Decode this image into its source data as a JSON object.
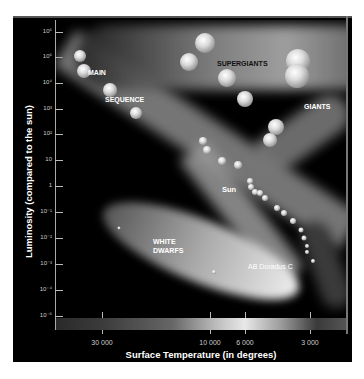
{
  "chart_data": {
    "type": "scatter",
    "xlabel": "Surface Temperature (in degrees)",
    "ylabel": "Luminosity (compared to the sun)",
    "x_scale": "log, reversed (hot on left)",
    "y_scale": "log",
    "x_tick_labels": [
      "30 000",
      "10 000",
      "6 000",
      "3 000"
    ],
    "y_tick_labels": [
      "10^6",
      "10^5",
      "10^4",
      "10^3",
      "10^2",
      "10",
      "1",
      "10^-1",
      "10^-2",
      "10^-3",
      "10^-4",
      "10^-5"
    ],
    "ylim": [
      "10^-5",
      "10^6"
    ],
    "grid": false,
    "regions": [
      "SUPERGIANTS",
      "GIANTS",
      "MAIN SEQUENCE",
      "WHITE DWARFS"
    ],
    "annotations": [
      "Sun",
      "AB Doradus C"
    ],
    "colorbar": "temperature color strip (blue-white on left to red on right)"
  },
  "axes": {
    "y_title": "Luminosity (compared to the sun)",
    "x_title": "Surface Temperature (in degrees)",
    "y_ticks": [
      {
        "label": "10⁶",
        "y": 32
      },
      {
        "label": "10⁵",
        "y": 57
      },
      {
        "label": "10⁴",
        "y": 83
      },
      {
        "label": "10³",
        "y": 109
      },
      {
        "label": "10²",
        "y": 134
      },
      {
        "label": "10",
        "y": 160
      },
      {
        "label": "1",
        "y": 186
      },
      {
        "label": "10⁻¹",
        "y": 212
      },
      {
        "label": "10⁻²",
        "y": 238
      },
      {
        "label": "10⁻³",
        "y": 264
      },
      {
        "label": "10⁻⁴",
        "y": 290
      },
      {
        "label": "10⁻⁵",
        "y": 316
      }
    ],
    "x_ticks": [
      {
        "label": "30 000",
        "x": 102
      },
      {
        "label": "10 000",
        "x": 210
      },
      {
        "label": "6 000",
        "x": 245
      },
      {
        "label": "3 000",
        "x": 310
      }
    ]
  },
  "labels": {
    "supergiants": "SUPERGIANTS",
    "giants": "GIANTS",
    "main": "MAIN",
    "sequence": "SEQUENCE",
    "white": "WHITE",
    "dwarfs": "DWARFS",
    "sun": "Sun",
    "ab_doradus": "AB Doradus C"
  },
  "stars": [
    {
      "x": 80,
      "y": 56,
      "r": 6
    },
    {
      "x": 84,
      "y": 71,
      "r": 7
    },
    {
      "x": 110,
      "y": 90,
      "r": 7
    },
    {
      "x": 136,
      "y": 113,
      "r": 6
    },
    {
      "x": 205,
      "y": 43,
      "r": 10
    },
    {
      "x": 189,
      "y": 62,
      "r": 9
    },
    {
      "x": 227,
      "y": 78,
      "r": 9
    },
    {
      "x": 245,
      "y": 99,
      "r": 8
    },
    {
      "x": 298,
      "y": 61,
      "r": 12
    },
    {
      "x": 297,
      "y": 76,
      "r": 12
    },
    {
      "x": 276,
      "y": 127,
      "r": 8
    },
    {
      "x": 270,
      "y": 140,
      "r": 7
    },
    {
      "x": 203,
      "y": 141,
      "r": 4
    },
    {
      "x": 207,
      "y": 150,
      "r": 4
    },
    {
      "x": 222,
      "y": 161,
      "r": 4
    },
    {
      "x": 238,
      "y": 165,
      "r": 4
    },
    {
      "x": 250,
      "y": 181,
      "r": 3
    },
    {
      "x": 251,
      "y": 187,
      "r": 3
    },
    {
      "x": 255,
      "y": 192,
      "r": 3
    },
    {
      "x": 260,
      "y": 193,
      "r": 3
    },
    {
      "x": 265,
      "y": 198,
      "r": 3
    },
    {
      "x": 277,
      "y": 208,
      "r": 3
    },
    {
      "x": 284,
      "y": 213,
      "r": 3
    },
    {
      "x": 293,
      "y": 221,
      "r": 3
    },
    {
      "x": 301,
      "y": 230,
      "r": 2.5
    },
    {
      "x": 304,
      "y": 238,
      "r": 2.5
    },
    {
      "x": 307,
      "y": 246,
      "r": 2
    },
    {
      "x": 307,
      "y": 252,
      "r": 2
    },
    {
      "x": 313,
      "y": 261,
      "r": 2
    },
    {
      "x": 119,
      "y": 228,
      "r": 1.5
    },
    {
      "x": 214,
      "y": 272,
      "r": 2
    }
  ]
}
